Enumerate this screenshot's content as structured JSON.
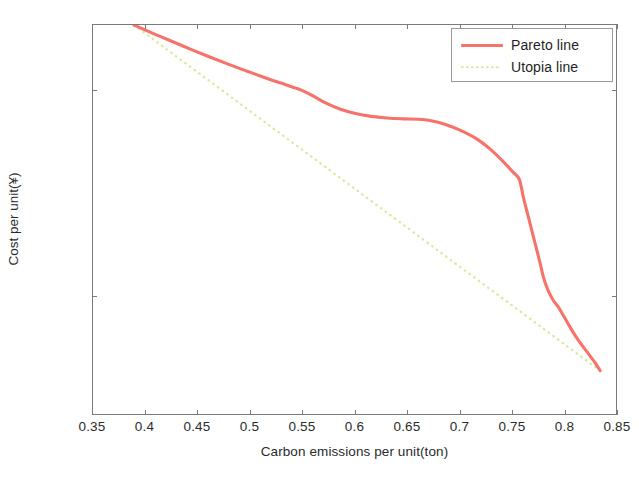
{
  "chart_data": {
    "type": "line",
    "title": "",
    "xlabel": "Carbon emissions per unit(ton)",
    "ylabel": "Cost per unit(¥)",
    "xlim": [
      0.35,
      0.85
    ],
    "ylim_log10": [
      0.742,
      0.932
    ],
    "yscale": "log",
    "grid": false,
    "legend_position": "top-right",
    "xticks": [
      "0.35",
      "0.4",
      "0.45",
      "0.5",
      "0.55",
      "0.6",
      "0.65",
      "0.7",
      "0.75",
      "0.8",
      "0.85"
    ],
    "xtick_values": [
      0.35,
      0.4,
      0.45,
      0.5,
      0.55,
      0.6,
      0.65,
      0.7,
      0.75,
      0.8,
      0.85
    ],
    "yticks": [
      {
        "mantissa": "10",
        "exponent": "0.9",
        "log10": 0.9
      },
      {
        "mantissa": "10",
        "exponent": "0.8",
        "log10": 0.8
      }
    ],
    "series": [
      {
        "name": "Pareto line",
        "color": "#f5736a",
        "style": "solid",
        "x": [
          0.389,
          0.4,
          0.415,
          0.43,
          0.445,
          0.46,
          0.475,
          0.49,
          0.505,
          0.52,
          0.532,
          0.545,
          0.553,
          0.562,
          0.572,
          0.585,
          0.6,
          0.615,
          0.63,
          0.645,
          0.66,
          0.672,
          0.685,
          0.7,
          0.715,
          0.728,
          0.74,
          0.75,
          0.756,
          0.76,
          0.765,
          0.77,
          0.775,
          0.779,
          0.783,
          0.788,
          0.793,
          0.798,
          0.805,
          0.812,
          0.82,
          0.828,
          0.833
        ],
        "y_log10": [
          0.932,
          0.9295,
          0.9262,
          0.923,
          0.9198,
          0.9167,
          0.9137,
          0.9108,
          0.908,
          0.9053,
          0.9033,
          0.901,
          0.8993,
          0.8968,
          0.894,
          0.8912,
          0.889,
          0.8876,
          0.8868,
          0.8864,
          0.8862,
          0.8855,
          0.8838,
          0.8808,
          0.8768,
          0.8718,
          0.866,
          0.8605,
          0.857,
          0.848,
          0.838,
          0.828,
          0.818,
          0.8095,
          0.8035,
          0.7985,
          0.795,
          0.7908,
          0.7846,
          0.779,
          0.7735,
          0.768,
          0.764
        ]
      },
      {
        "name": "Utopia line",
        "color": "#dbe69f",
        "style": "dotted",
        "x": [
          0.389,
          0.833
        ],
        "y_log10": [
          0.932,
          0.764
        ]
      }
    ]
  },
  "legend": {
    "items": [
      {
        "label": "Pareto line",
        "swatch": "solid-line-swatch"
      },
      {
        "label": "Utopia line",
        "swatch": "dotted-line-swatch"
      }
    ]
  },
  "colors": {
    "pareto": "#f5736a",
    "utopia": "#dbe69f",
    "axis": "#7a7a7a",
    "text": "#2b2b2b",
    "background": "#ffffff"
  }
}
